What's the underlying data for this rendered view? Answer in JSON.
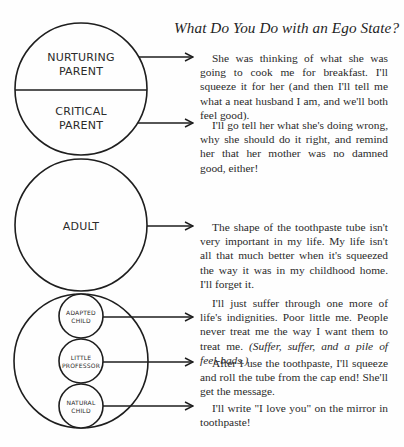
{
  "page": {
    "title": "What Do You Do with an Ego State?"
  },
  "diagram": {
    "parent_circle": {
      "top_label": [
        "NURTURING",
        "PARENT"
      ],
      "bottom_label": [
        "CRITICAL",
        "PARENT"
      ]
    },
    "adult_circle": {
      "label": "ADULT"
    },
    "child_circle": {
      "sub_circles": [
        {
          "label": [
            "ADAPTED",
            "CHILD"
          ]
        },
        {
          "label": [
            "LITTLE",
            "PROFESSOR"
          ]
        },
        {
          "label": [
            "NATURAL",
            "CHILD"
          ]
        }
      ]
    },
    "line_color": "#1e1e1e"
  },
  "responses": {
    "nurturing_parent": "She was thinking of what she was going to cook me for breakfast. I'll squeeze it for her (and then I'll tell me what a neat husband I am, and we'll both feel good).",
    "critical_parent": "I'll go tell her what she's doing wrong, why she should do it right, and remind her that her mother was no damned good, either!",
    "adult": "The shape of the toothpaste tube isn't very important in my life. My life isn't all that much better when it's squeezed the way it was in my childhood home. I'll for­get it.",
    "adapted_child": "I'll just suffer through one more of life's indignities. Poor little me. People never treat me the way I want them to treat me.",
    "adapted_child_italic": "(Suffer, suffer, and a pile of feel-bads.)",
    "little_professor": "After I use the toothpaste, I'll squeeze and roll the tube from the cap end! She'll get the message.",
    "natural_child": "I'll write \"I love you\" on the mirror in toothpaste!"
  }
}
